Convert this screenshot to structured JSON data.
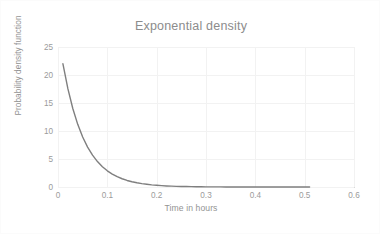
{
  "chart_data": {
    "type": "line",
    "title": "Exponential density",
    "xlabel": "Time in hours",
    "ylabel": "Probability density function",
    "xlim": [
      0,
      0.6
    ],
    "ylim": [
      0,
      25
    ],
    "xticks": [
      "0",
      "0.1",
      "0.2",
      "0.3",
      "0.4",
      "0.5",
      "0.6"
    ],
    "xtick_values": [
      0,
      0.1,
      0.2,
      0.3,
      0.4,
      0.5,
      0.6
    ],
    "yticks": [
      "0",
      "5",
      "10",
      "15",
      "20",
      "25"
    ],
    "ytick_values": [
      0,
      5,
      10,
      15,
      20,
      25
    ],
    "grid": true,
    "legend": "none",
    "series": [
      {
        "name": "Exponential density",
        "color": "#7f7f7f",
        "rate_lambda": 22.5,
        "x": [
          0.01,
          0.02,
          0.03,
          0.04,
          0.05,
          0.06,
          0.07,
          0.08,
          0.09,
          0.1,
          0.11,
          0.12,
          0.13,
          0.14,
          0.15,
          0.16,
          0.17,
          0.18,
          0.19,
          0.2,
          0.21,
          0.22,
          0.23,
          0.24,
          0.25,
          0.26,
          0.27,
          0.28,
          0.29,
          0.3,
          0.31,
          0.32,
          0.33,
          0.34,
          0.35,
          0.36,
          0.37,
          0.38,
          0.39,
          0.4,
          0.41,
          0.42,
          0.43,
          0.44,
          0.45,
          0.46,
          0.47,
          0.48,
          0.49,
          0.5,
          0.51
        ],
        "values": [
          22.0,
          17.56,
          14.02,
          11.19,
          8.93,
          7.13,
          5.69,
          4.54,
          3.63,
          2.89,
          2.31,
          1.84,
          1.47,
          1.17,
          0.94,
          0.75,
          0.6,
          0.48,
          0.38,
          0.3,
          0.24,
          0.19,
          0.15,
          0.12,
          0.1,
          0.08,
          0.06,
          0.05,
          0.04,
          0.03,
          0.025,
          0.02,
          0.016,
          0.013,
          0.01,
          0.008,
          0.006,
          0.005,
          0.004,
          0.003,
          0.0026,
          0.0021,
          0.0016,
          0.0013,
          0.0011,
          0.0008,
          0.0007,
          0.0005,
          0.0004,
          0.0003,
          0.0003
        ]
      }
    ]
  },
  "colors": {
    "curve": "#7f7f7f",
    "gridline": "#f2f2f2",
    "axis": "#d9d9d9",
    "title_text": "#8c8c8c",
    "tick_text": "#9b9b9b",
    "axis_title_text": "#939393",
    "background": "#ffffff"
  }
}
